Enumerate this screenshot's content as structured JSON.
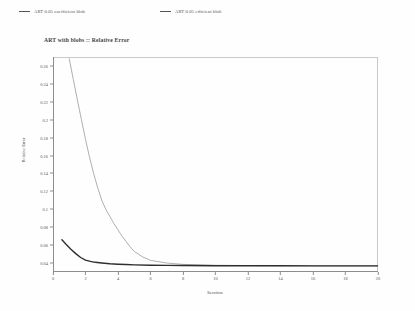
{
  "legend": {
    "position": "top",
    "items": [
      {
        "label": "ART 0.05 coefficient blob",
        "color": "#8f8f8f",
        "marker": "legend-line-icon"
      },
      {
        "label": "ART 0.05 efficient blob",
        "color": "#3a3a3a",
        "marker": "legend-line-icon"
      }
    ]
  },
  "chart_data": {
    "type": "line",
    "title": "ART  with blobs :: Relative Error",
    "xlabel": "Iteration",
    "ylabel": "Relative Error",
    "xlim": [
      0,
      20
    ],
    "ylim": [
      0.03,
      0.27
    ],
    "grid": false,
    "xticks": [
      0,
      2,
      4,
      6,
      8,
      10,
      12,
      14,
      16,
      18,
      20
    ],
    "xtick_labels": [
      "0",
      "2",
      "4",
      "6",
      "8",
      "10",
      "12",
      "14",
      "16",
      "18",
      "20"
    ],
    "yticks": [
      0.04,
      0.06,
      0.08,
      0.1,
      0.12,
      0.14,
      0.16,
      0.18,
      0.2,
      0.22,
      0.24,
      0.26
    ],
    "ytick_labels": [
      "0.04",
      "0.06",
      "0.08",
      "0.1",
      "0.12",
      "0.14",
      "0.16",
      "0.18",
      "0.2",
      "0.22",
      "0.24",
      "0.26"
    ],
    "series": [
      {
        "name": "ART 0.05 coefficient blob",
        "color": "#9a9a9a",
        "width": 0.8,
        "x": [
          1.0,
          1.25,
          1.5,
          1.75,
          2.0,
          2.25,
          2.5,
          2.75,
          3.0,
          3.25,
          3.5,
          3.75,
          4.0,
          4.25,
          4.5,
          4.75,
          5.0,
          5.5,
          6.0,
          7.0,
          8.0,
          10.0,
          12.0,
          14.0,
          16.0,
          18.0,
          20.0
        ],
        "y": [
          0.268,
          0.245,
          0.222,
          0.2,
          0.178,
          0.158,
          0.14,
          0.124,
          0.11,
          0.1,
          0.092,
          0.084,
          0.077,
          0.07,
          0.064,
          0.058,
          0.053,
          0.047,
          0.043,
          0.04,
          0.0385,
          0.0375,
          0.0372,
          0.037,
          0.0369,
          0.0368,
          0.0368
        ]
      },
      {
        "name": "ART 0.05 efficient blob",
        "color": "#2e2e2e",
        "width": 1.4,
        "x": [
          0.55,
          0.8,
          1.1,
          1.4,
          1.7,
          2.0,
          2.3,
          2.6,
          3.0,
          3.5,
          4.0,
          4.5,
          5.0,
          6.0,
          7.0,
          8.0,
          10.0,
          12.0,
          14.0,
          16.0,
          18.0,
          20.0
        ],
        "y": [
          0.066,
          0.061,
          0.0555,
          0.0505,
          0.0462,
          0.0432,
          0.0418,
          0.0408,
          0.04,
          0.0392,
          0.0387,
          0.0383,
          0.038,
          0.0376,
          0.0374,
          0.0372,
          0.037,
          0.0369,
          0.0369,
          0.0368,
          0.0368,
          0.0368
        ]
      }
    ]
  }
}
